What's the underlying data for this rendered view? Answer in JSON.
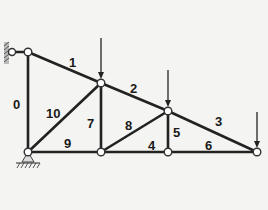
{
  "diagram": {
    "type": "planar-truss",
    "background": "#f4f4f2",
    "line_color": "#222222",
    "nodes": [
      {
        "id": "A",
        "x": 28,
        "y": 52
      },
      {
        "id": "B",
        "x": 101,
        "y": 83
      },
      {
        "id": "C",
        "x": 168,
        "y": 111
      },
      {
        "id": "F",
        "x": 257,
        "y": 152
      },
      {
        "id": "G",
        "x": 28,
        "y": 152
      },
      {
        "id": "D",
        "x": 101,
        "y": 152
      },
      {
        "id": "E",
        "x": 168,
        "y": 152
      }
    ],
    "members": [
      {
        "label": "0",
        "from": "A",
        "to": "G",
        "label_x": 13,
        "label_y": 109
      },
      {
        "label": "1",
        "from": "A",
        "to": "B",
        "label_x": 69,
        "label_y": 67
      },
      {
        "label": "2",
        "from": "B",
        "to": "C",
        "label_x": 130,
        "label_y": 93
      },
      {
        "label": "3",
        "from": "C",
        "to": "F",
        "label_x": 215,
        "label_y": 126
      },
      {
        "label": "4",
        "from": "D",
        "to": "E",
        "label_x": 148,
        "label_y": 150
      },
      {
        "label": "5",
        "from": "C",
        "to": "E",
        "label_x": 173,
        "label_y": 137
      },
      {
        "label": "6",
        "from": "E",
        "to": "F",
        "label_x": 205,
        "label_y": 150
      },
      {
        "label": "7",
        "from": "B",
        "to": "D",
        "label_x": 87,
        "label_y": 128
      },
      {
        "label": "8",
        "from": "D",
        "to": "C",
        "label_x": 125,
        "label_y": 130
      },
      {
        "label": "9",
        "from": "G",
        "to": "D",
        "label_x": 64,
        "label_y": 148
      },
      {
        "label": "10",
        "from": "G",
        "to": "B",
        "label_x": 46,
        "label_y": 118
      }
    ],
    "loads": [
      {
        "node": "B",
        "direction": "down",
        "start_y": 38
      },
      {
        "node": "C",
        "direction": "down",
        "start_y": 70
      },
      {
        "node": "F",
        "direction": "down",
        "start_y": 112
      }
    ],
    "supports": [
      {
        "node": "A",
        "type": "wall-pin",
        "side": "left"
      },
      {
        "node": "G",
        "type": "ground-pin",
        "side": "bottom"
      }
    ]
  }
}
